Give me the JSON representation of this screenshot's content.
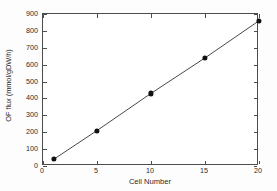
{
  "chart_data": {
    "type": "scatter",
    "title": "",
    "xlabel": "Cell Number",
    "ylabel": "OF flux (mmol/gDW/h)",
    "xlim": [
      0,
      20
    ],
    "ylim": [
      0,
      900
    ],
    "grid": false,
    "legend": null,
    "xticks": [
      0,
      5,
      10,
      15,
      20
    ],
    "yticks": [
      0,
      100,
      200,
      300,
      400,
      500,
      600,
      700,
      800,
      900
    ],
    "xtick_labels": [
      "0",
      "5",
      "10",
      "15",
      "20"
    ],
    "ytick_labels": [
      "0",
      "100",
      "200",
      "300",
      "400",
      "500",
      "600",
      "700",
      "800",
      "900"
    ],
    "series": [
      {
        "name": "OF flux",
        "marker": "filled-circle",
        "marker_color": "#111111",
        "line_color": "#333333",
        "line_style": "solid",
        "x": [
          1,
          5,
          10,
          15,
          20
        ],
        "y": [
          40,
          210,
          430,
          640,
          860
        ]
      }
    ]
  },
  "figure": {
    "background_color": "#ffffff",
    "frame_color": "#4d4d4d"
  }
}
